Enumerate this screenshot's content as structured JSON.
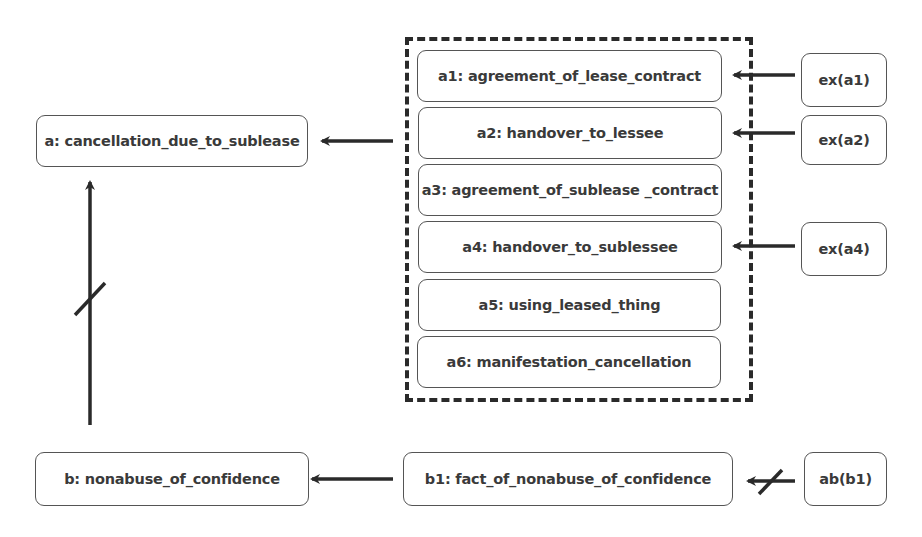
{
  "nodes": {
    "a": {
      "label": "a: cancellation_due_to_sublease"
    },
    "a1": {
      "label": "a1: agreement_of_lease_contract"
    },
    "a2": {
      "label": "a2: handover_to_lessee"
    },
    "a3": {
      "label": "a3: agreement_of_sublease _contract"
    },
    "a4": {
      "label": "a4: handover_to_sublessee"
    },
    "a5": {
      "label": "a5: using_leased_thing"
    },
    "a6": {
      "label": "a6: manifestation_cancellation"
    },
    "ex_a1": {
      "label": "ex(a1)"
    },
    "ex_a2": {
      "label": "ex(a2)"
    },
    "ex_a4": {
      "label": "ex(a4)"
    },
    "b": {
      "label": "b: nonabuse_of_confidence"
    },
    "b1": {
      "label": "b1: fact_of_nonabuse_of_confidence"
    },
    "ab_b1": {
      "label": "ab(b1)"
    }
  },
  "edges": [
    {
      "from": "a1-a6 group",
      "to": "a",
      "type": "support"
    },
    {
      "from": "ex_a1",
      "to": "a1",
      "type": "support"
    },
    {
      "from": "ex_a2",
      "to": "a2",
      "type": "support"
    },
    {
      "from": "ex_a4",
      "to": "a4",
      "type": "support"
    },
    {
      "from": "b",
      "to": "a",
      "type": "attack"
    },
    {
      "from": "b1",
      "to": "b",
      "type": "support"
    },
    {
      "from": "ab_b1",
      "to": "b1",
      "type": "attack"
    }
  ],
  "colors": {
    "stroke": "#2a2a2a",
    "border": "#555555",
    "text": "#3a3a3a"
  }
}
